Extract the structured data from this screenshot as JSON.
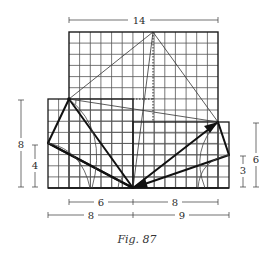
{
  "figure": {
    "caption": "Fig. 87",
    "dimensions": {
      "top_width": "14",
      "left_height_outer": "8",
      "left_height_inner": "4",
      "right_height_outer": "6",
      "right_height_inner": "3",
      "bottom_row1_left": "6",
      "bottom_row1_right": "8",
      "bottom_row2_left": "8",
      "bottom_row2_right": "9"
    },
    "colors": {
      "ink": "#1a1a1a",
      "grid": "#555555",
      "background": "#ffffff"
    }
  }
}
